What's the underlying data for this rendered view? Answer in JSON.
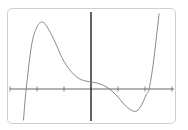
{
  "chart_data": {
    "type": "line",
    "title": "",
    "xlabel": "",
    "ylabel": "",
    "grid": false,
    "legend": null,
    "axes": {
      "x_ticks": [
        -3,
        -2,
        -1,
        0,
        1,
        2,
        3
      ],
      "x_tick_labels_visible": false,
      "y_ticks_visible": false,
      "xlim": [
        -3,
        3
      ],
      "origin_px": [
        91,
        89
      ],
      "unit_px": 27
    },
    "series": [
      {
        "name": "polynomial curve",
        "description": "Quintic-like polynomial: rises steeply from lower left, local max near x=-1.8, descends through an inflection near the origin (y-intercept slightly positive), local min near x=1.7, then rises steeply to the upper right",
        "x": [
          -2.5,
          -2.4,
          -2.2,
          -2.0,
          -1.8,
          -1.6,
          -1.33,
          -1.07,
          -0.78,
          -0.48,
          -0.22,
          0.0,
          0.33,
          0.63,
          0.93,
          1.22,
          1.48,
          1.7,
          1.89,
          2.04,
          2.15,
          2.3,
          2.41,
          2.52
        ],
        "y": [
          -1.15,
          0.0,
          1.63,
          2.3,
          2.48,
          2.26,
          1.74,
          1.15,
          0.7,
          0.41,
          0.3,
          0.26,
          0.19,
          0.04,
          -0.22,
          -0.56,
          -0.78,
          -0.81,
          -0.56,
          -0.22,
          0.0,
          0.89,
          1.81,
          2.78
        ]
      }
    ],
    "features": {
      "local_max": {
        "x": -1.8,
        "y": 2.48
      },
      "local_min": {
        "x": 1.7,
        "y": -0.81
      },
      "x_intercepts": [
        -2.4,
        2.15
      ],
      "y_intercept": 0.26
    }
  },
  "colors": {
    "frame": "#cfcfcf",
    "x_axis": "#666666",
    "y_axis": "#222222",
    "curve": "#8a8a8a",
    "background": "#ffffff"
  }
}
